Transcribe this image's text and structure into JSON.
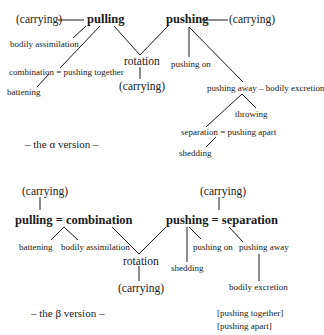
{
  "alpha": {
    "caption": "– the α version –",
    "nodes": {
      "carrying_left": "(carrying)",
      "pulling": "pulling",
      "pushing": "pushing",
      "carrying_right": "(carrying)",
      "bodily_assimilation": "bodily assimilation",
      "combination": "combination = pushing together",
      "battening": "battening",
      "rotation": "rotation",
      "carrying_bottom": "(carrying)",
      "pushing_on": "pushing on",
      "pushing_away": "pushing away – bodily excretion",
      "throwing": "throwing",
      "separation": "separation = pushing apart",
      "shedding": "shedding"
    }
  },
  "beta": {
    "caption": "– the β version –",
    "nodes": {
      "carrying_top_left": "(carrying)",
      "pulling_combination": "pulling = combination",
      "carrying_top_right": "(carrying)",
      "pushing_separation": "pushing = separation",
      "battening": "battening",
      "bodily_assimilation": "bodily assimilation",
      "rotation": "rotation",
      "carrying_bottom": "(carrying)",
      "shedding": "shedding",
      "pushing_on": "pushing on",
      "pushing_away": "pushing away",
      "bodily_excretion": "bodily excretion"
    },
    "legend": [
      "[pushing together]",
      "[pushing apart]"
    ]
  }
}
